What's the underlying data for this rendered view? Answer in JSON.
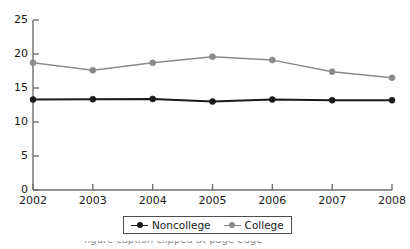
{
  "chart_data": {
    "type": "line",
    "title": "",
    "subtitle": "",
    "xlabel": "",
    "ylabel": "",
    "categories": [
      "2002",
      "2003",
      "2004",
      "2005",
      "2006",
      "2007",
      "2008"
    ],
    "ylim": [
      0,
      25
    ],
    "yticks": [
      0,
      5,
      10,
      15,
      20,
      25
    ],
    "ytick_labels": [
      "0",
      "5",
      "10",
      "15",
      "20",
      "25"
    ],
    "grid": false,
    "legend_position": "bottom-center",
    "series": [
      {
        "name": "Noncollege",
        "color": "#1a1a1a",
        "marker": "circle",
        "values": [
          13.3,
          13.35,
          13.4,
          13.0,
          13.3,
          13.2,
          13.2
        ]
      },
      {
        "name": "College",
        "color": "#8a8a8a",
        "marker": "circle",
        "values": [
          18.7,
          17.6,
          18.7,
          19.6,
          19.1,
          17.4,
          16.5
        ]
      }
    ]
  },
  "axes": {
    "y_axis_name": "y-axis",
    "x_axis_name": "x-axis"
  },
  "legend": {
    "entries": [
      {
        "label": "Noncollege",
        "color": "#1a1a1a"
      },
      {
        "label": "College",
        "color": "#8a8a8a"
      }
    ]
  },
  "caption": {
    "clipped_text": "figure caption clipped at page edge"
  },
  "colors": {
    "noncollege": "#1a1a1a",
    "college": "#8a8a8a",
    "axis": "#6e6e6e",
    "text": "#1a1a1a",
    "background": "#ffffff"
  }
}
